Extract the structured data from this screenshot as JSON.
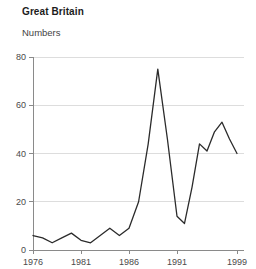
{
  "header": {
    "title": "Great Britain",
    "subtitle": "Numbers"
  },
  "chart_data": {
    "type": "line",
    "title": "Great Britain",
    "subtitle": "Numbers",
    "xlabel": "",
    "ylabel": "Numbers",
    "grid": true,
    "legend": false,
    "line_color": "#2b2b2b",
    "grid_color": "#dddddd",
    "axis_color": "#8a8a8a",
    "xlim": [
      1976,
      1999
    ],
    "ylim": [
      0,
      80
    ],
    "yticks": [
      0,
      20,
      40,
      60,
      80
    ],
    "ytick_labels": [
      "0",
      "20",
      "40",
      "60",
      "80"
    ],
    "xticks": [
      1976,
      1981,
      1986,
      1991,
      1999
    ],
    "xtick_labels": [
      "1976",
      "1981",
      "1986",
      "1991",
      "1999"
    ],
    "x": [
      1976,
      1977,
      1978,
      1979,
      1980,
      1981,
      1982,
      1983,
      1984,
      1985,
      1986,
      1987,
      1988,
      1989,
      1990,
      1991,
      1992,
      1993,
      1994,
      1995,
      1996,
      1997,
      1998,
      1999
    ],
    "series": [
      {
        "name": "Great Britain",
        "values": [
          6,
          5,
          3,
          5,
          7,
          4,
          3,
          6,
          9,
          6,
          9,
          20,
          44,
          75,
          46,
          14,
          11,
          26,
          44,
          41,
          49,
          53,
          46,
          40
        ]
      }
    ]
  }
}
